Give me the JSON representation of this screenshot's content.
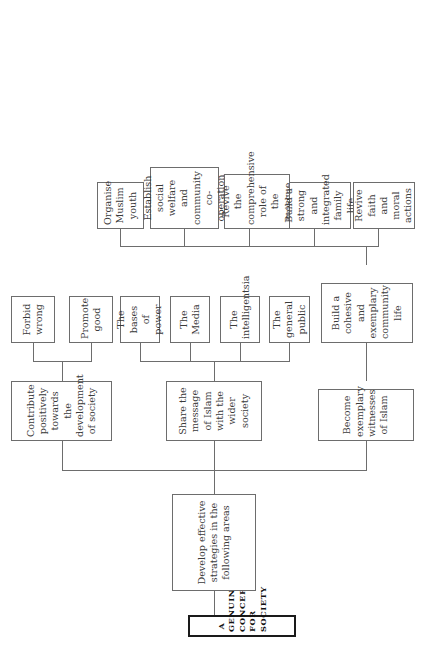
{
  "diagram": {
    "type": "organizational-tree",
    "orientation": "rotated-90-counterclockwise",
    "root": {
      "label": "A GENUINE CONCERN FOR SOCIETY"
    },
    "level1": [
      {
        "label": "Develop effective strategies in the following areas"
      }
    ],
    "level2": [
      {
        "label": "Contribute positively towards the development of society"
      },
      {
        "label": "Share the message of Islam with the wider society"
      },
      {
        "label": "Become exemplary witnesses of Islam"
      }
    ],
    "contribute_children": [
      {
        "label": "Forbid wrong"
      },
      {
        "label": "Promote good"
      }
    ],
    "share_children": [
      {
        "label": "The bases of power"
      },
      {
        "label": "The Media"
      },
      {
        "label": "The intelligentsia"
      },
      {
        "label": "The general public"
      }
    ],
    "witness_children": [
      {
        "label": "Build a cohesive and exemplary community life"
      }
    ],
    "community_children": [
      {
        "label": "Organise Muslim youth"
      },
      {
        "label": "Establish social welfare and community co-operation"
      },
      {
        "label": "Revive the comprehensive role of the mosque"
      },
      {
        "label": "Build a strong and integrated family life"
      },
      {
        "label": "Revive faith and moral actions"
      }
    ],
    "colors": {
      "background": "#ffffff",
      "box_border": "#6d6d6d",
      "root_border": "#1a1a1a",
      "connector": "#6d6d6d",
      "text": "#3a3a3a"
    }
  }
}
